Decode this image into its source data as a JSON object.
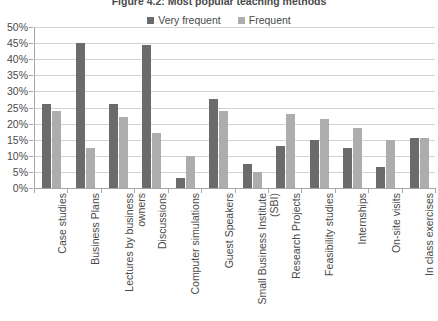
{
  "chart_data": {
    "type": "bar",
    "title": "Figure 4.2: Most popular teaching methods",
    "xlabel": "",
    "ylabel": "",
    "ylim": [
      0,
      50
    ],
    "ytick_step": 5,
    "ytick_labels": [
      "50%",
      "45%",
      "40%",
      "35%",
      "30%",
      "25%",
      "20%",
      "15%",
      "10%",
      "5%",
      "0%"
    ],
    "grid": true,
    "legend_position": "top-center",
    "categories": [
      "Case studies",
      "Business Plans",
      "Lectures by business owners",
      "Discussions",
      "Computer simulations",
      "Guest Speakers",
      "Small Business Institute (SBI)",
      "Research Projects",
      "Feasibility studies",
      "Internships",
      "On-site visits",
      "In class exercises"
    ],
    "series": [
      {
        "name": "Very frequent",
        "color": "#6b6b6b",
        "values": [
          26,
          45,
          26,
          44.5,
          3,
          27.5,
          7.5,
          13,
          15,
          12.5,
          6.5,
          15.5
        ]
      },
      {
        "name": "Frequent",
        "color": "#adadad",
        "values": [
          24,
          12.5,
          22,
          17,
          10,
          24,
          5,
          23,
          21.5,
          18.5,
          15,
          15.5
        ]
      }
    ]
  }
}
